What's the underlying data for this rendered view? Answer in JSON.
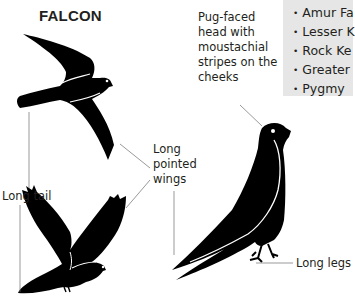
{
  "title": "FALCON",
  "species": {
    "items": [
      {
        "label": "Amur Fa"
      },
      {
        "label": "Lesser K"
      },
      {
        "label": "Rock Ke"
      },
      {
        "label": "Greater"
      },
      {
        "label": "Pygmy"
      }
    ]
  },
  "annotations": {
    "head": "Pug-faced head with moustachial stripes on the cheeks",
    "tail": "Long tail",
    "wings": "Long pointed wings",
    "legs": "Long legs"
  },
  "colors": {
    "silhouette": "#000000",
    "text": "#231f20",
    "box_bg": "#e6e6e6",
    "line": "#6d6d6d"
  }
}
